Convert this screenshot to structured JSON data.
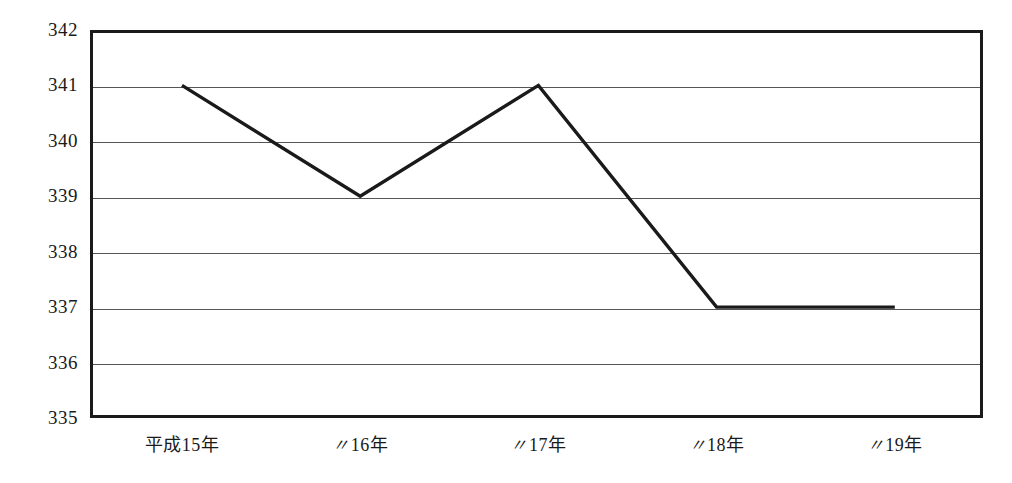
{
  "chart_data": {
    "type": "line",
    "title": "",
    "subtitle": "",
    "xlabel": "",
    "ylabel": "",
    "categories": [
      "平成15年",
      "〃16年",
      "〃17年",
      "〃18年",
      "〃19年"
    ],
    "category_parts": [
      {
        "prefix": "平成",
        "number": "15",
        "suffix": "年",
        "is_ditto": false
      },
      {
        "prefix": "〃",
        "number": "16",
        "suffix": "年",
        "is_ditto": true
      },
      {
        "prefix": "〃",
        "number": "17",
        "suffix": "年",
        "is_ditto": true
      },
      {
        "prefix": "〃",
        "number": "18",
        "suffix": "年",
        "is_ditto": true
      },
      {
        "prefix": "〃",
        "number": "19",
        "suffix": "年",
        "is_ditto": true
      }
    ],
    "values": [
      341,
      339,
      341,
      337,
      337
    ],
    "series": [
      {
        "name": "",
        "values": [
          341,
          339,
          341,
          337,
          337
        ]
      }
    ],
    "ylim": [
      335,
      342
    ],
    "yticks": [
      342,
      341,
      340,
      339,
      338,
      337,
      336,
      335
    ],
    "ytick_labels": [
      "342",
      "341",
      "340",
      "339",
      "338",
      "337",
      "336",
      "335"
    ],
    "grid": true,
    "grid_axis": "y",
    "legend": false,
    "legend_position": "none",
    "markers": false,
    "line_color": "#1a1a1a",
    "grid_color": "#555555",
    "border_color": "#1a1a1a",
    "background_color": "#ffffff"
  }
}
